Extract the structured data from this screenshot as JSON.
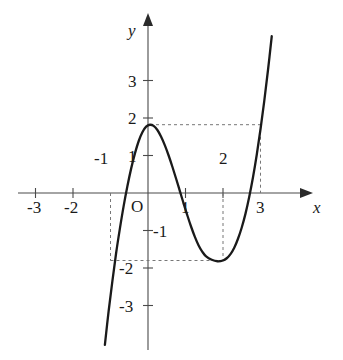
{
  "chart_data": {
    "type": "line",
    "title": "",
    "xlabel": "x",
    "ylabel": "y",
    "origin_label": "O",
    "grid": false,
    "legend": null,
    "xlim": [
      -3.6,
      4.2
    ],
    "ylim": [
      -4.4,
      4.4
    ],
    "x_ticks": [
      {
        "value": -3,
        "label": "-3",
        "side": "below"
      },
      {
        "value": -2,
        "label": "-2",
        "side": "below"
      },
      {
        "value": -1,
        "label": "-1",
        "side": "above"
      },
      {
        "value": 1,
        "label": "1",
        "side": "below"
      },
      {
        "value": 2,
        "label": "2",
        "side": "above"
      },
      {
        "value": 3,
        "label": "3",
        "side": "below"
      }
    ],
    "y_ticks": [
      {
        "value": 3,
        "label": "3"
      },
      {
        "value": 2,
        "label": "2"
      },
      {
        "value": 1,
        "label": "1"
      },
      {
        "value": -1,
        "label": "-1"
      },
      {
        "value": -2,
        "label": "-2"
      },
      {
        "value": -3,
        "label": "-3"
      }
    ],
    "series": [
      {
        "name": "cubic-curve",
        "color": "#1a1a1a",
        "x_range": [
          -1.15,
          3.5
        ],
        "points": [
          [
            -1.15,
            -4.05
          ],
          [
            -1.05,
            -3.15
          ],
          [
            -0.95,
            -2.35
          ],
          [
            -0.85,
            -1.6
          ],
          [
            -0.75,
            -0.95
          ],
          [
            -0.65,
            -0.35
          ],
          [
            -0.55,
            0.18
          ],
          [
            -0.45,
            0.65
          ],
          [
            -0.35,
            1.05
          ],
          [
            -0.25,
            1.38
          ],
          [
            -0.15,
            1.62
          ],
          [
            -0.05,
            1.77
          ],
          [
            0.05,
            1.82
          ],
          [
            0.15,
            1.79
          ],
          [
            0.25,
            1.68
          ],
          [
            0.35,
            1.5
          ],
          [
            0.45,
            1.27
          ],
          [
            0.55,
            1.0
          ],
          [
            0.65,
            0.7
          ],
          [
            0.75,
            0.38
          ],
          [
            0.85,
            0.05
          ],
          [
            0.95,
            -0.28
          ],
          [
            1.05,
            -0.6
          ],
          [
            1.15,
            -0.9
          ],
          [
            1.25,
            -1.17
          ],
          [
            1.35,
            -1.4
          ],
          [
            1.45,
            -1.57
          ],
          [
            1.55,
            -1.69
          ],
          [
            1.7,
            -1.78
          ],
          [
            1.85,
            -1.82
          ],
          [
            2.0,
            -1.8
          ],
          [
            2.1,
            -1.74
          ],
          [
            2.2,
            -1.63
          ],
          [
            2.3,
            -1.46
          ],
          [
            2.4,
            -1.22
          ],
          [
            2.5,
            -0.92
          ],
          [
            2.6,
            -0.55
          ],
          [
            2.7,
            -0.1
          ],
          [
            2.8,
            0.42
          ],
          [
            2.9,
            1.02
          ],
          [
            3.0,
            1.7
          ],
          [
            3.1,
            2.45
          ],
          [
            3.2,
            3.28
          ],
          [
            3.3,
            4.18
          ]
        ]
      }
    ],
    "annotations": [
      {
        "name": "local-maximum",
        "x": 0.05,
        "y": 1.82,
        "label": ""
      },
      {
        "name": "local-minimum",
        "x": 1.95,
        "y": -1.8,
        "label": ""
      }
    ],
    "guide_lines": [
      {
        "name": "max-horizontal-guide",
        "orientation": "horizontal",
        "y": 1.82,
        "from_x": 0.05,
        "to_x": 3.0
      },
      {
        "name": "x-equals-3-vertical-guide",
        "orientation": "vertical",
        "x": 3.0,
        "from_y": 0.0,
        "to_y": 1.82
      },
      {
        "name": "x-equals-minus-1-vertical-guide",
        "orientation": "vertical",
        "x": -1.0,
        "from_y": -1.8,
        "to_y": 0.0
      },
      {
        "name": "min-horizontal-guide",
        "orientation": "horizontal",
        "y": -1.8,
        "from_x": -1.0,
        "to_x": 1.95
      },
      {
        "name": "x-equals-2-vertical-guide",
        "orientation": "vertical",
        "x": 2.0,
        "from_y": -1.8,
        "to_y": 0.0
      }
    ],
    "colors": {
      "curve": "#1a1a1a",
      "axis": "#4a4a4a",
      "guide": "#777777",
      "text": "#1a1a1a",
      "background": "#ffffff"
    }
  }
}
